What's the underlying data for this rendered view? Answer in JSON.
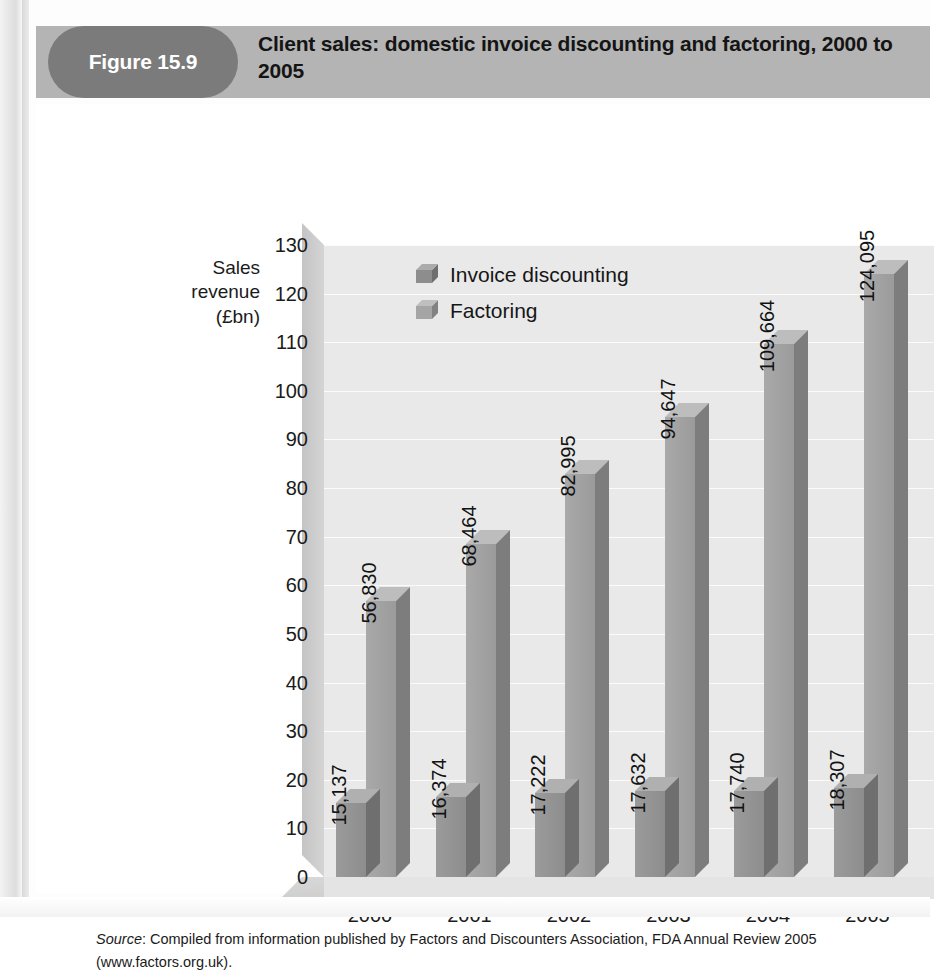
{
  "figure": {
    "badge_label": "Figure 15.9",
    "title": "Client sales: domestic invoice discounting and factoring, 2000 to 2005"
  },
  "source": {
    "prefix": "Source",
    "text": ": Compiled from information published by Factors and Discounters Association, FDA Annual Review 2005 (www.factors.org.uk)."
  },
  "colors": {
    "header_band": "#b4b4b4",
    "badge": "#7b7b7b",
    "plot_background": "#e9e9e9",
    "invoice_discounting": "#8d8d8d",
    "factoring": "#a5a5a5"
  },
  "chart_data": {
    "type": "bar",
    "title": "Client sales: domestic invoice discounting and factoring, 2000 to 2005",
    "xlabel": "",
    "ylabel": "Sales revenue (£bn)",
    "ylabel_lines": [
      "Sales",
      "revenue",
      "(£bn)"
    ],
    "categories": [
      "2000",
      "2001",
      "2002",
      "2003",
      "2004",
      "2005"
    ],
    "yticks": [
      0,
      10,
      20,
      30,
      40,
      50,
      60,
      70,
      80,
      90,
      100,
      110,
      120,
      130
    ],
    "ylim": [
      0,
      130
    ],
    "grid": true,
    "legend_position": "top-left-inside",
    "series": [
      {
        "name": "Invoice discounting",
        "color": "#8d8d8d",
        "values": [
          15.137,
          16.374,
          17.222,
          17.632,
          17.74,
          18.307
        ],
        "labels": [
          "15,137",
          "16,374",
          "17,222",
          "17,632",
          "17,740",
          "18,307"
        ]
      },
      {
        "name": "Factoring",
        "color": "#a5a5a5",
        "values": [
          56.83,
          68.464,
          82.995,
          94.647,
          109.664,
          124.095
        ],
        "labels": [
          "56,830",
          "68,464",
          "82,995",
          "94,647",
          "109,664",
          "124,095"
        ]
      }
    ]
  }
}
